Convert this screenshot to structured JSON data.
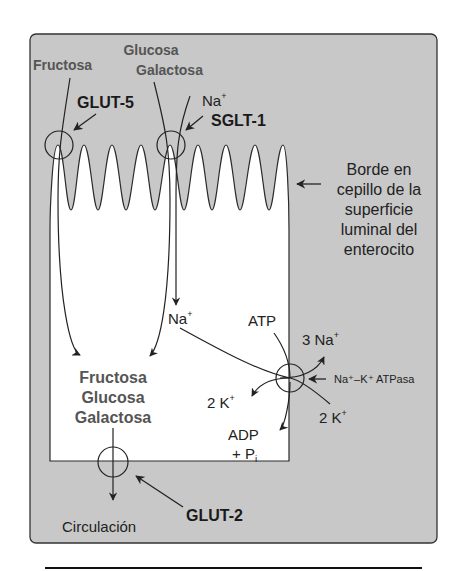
{
  "diagram": {
    "topic": "Absorción de monosacáridos en el enterocito",
    "lumen_labels": {
      "fructosa": "Fructosa",
      "glucosa": "Glucosa",
      "galactosa": "Galactosa",
      "na_plus": "Na",
      "plus": "+"
    },
    "transporters": {
      "glut5": "GLUT-5",
      "sglt1": "SGLT-1",
      "glut2": "GLUT-2",
      "pump": "Na⁺–K⁺ ATPasa"
    },
    "brush_border": [
      "Borde en",
      "cepillo de la",
      "superficie",
      "luminal del",
      "enterocito"
    ],
    "cell_sugars": [
      "Fructosa",
      "Glucosa",
      "Galactosa"
    ],
    "pump_labels": {
      "na_in": "Na",
      "atp": "ATP",
      "three_na": "3 Na",
      "two_k_out": "2 K",
      "two_k_in": "2 K",
      "adp": "ADP",
      "pi": "+ P",
      "pi_sub": "i",
      "plus": "+"
    },
    "circulation": "Circulación",
    "colors": {
      "panel": "#c8c8c8",
      "cell": "#ffffff",
      "stroke": "#2a2a2a",
      "sugar_text": "#555555"
    }
  }
}
